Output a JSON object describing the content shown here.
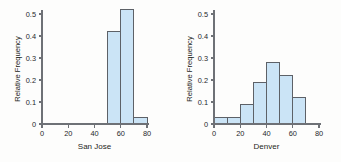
{
  "figure": {
    "background_color": "#fdfdfc",
    "bar_fill_color": "#cbe4f6",
    "bar_edge_color": "#5d6167",
    "axis_color": "#6e7176"
  },
  "chart_data": [
    {
      "type": "bar",
      "title": "",
      "xlabel": "San Jose",
      "ylabel": "Relative Frequency",
      "xlim": [
        0,
        80
      ],
      "ylim": [
        0,
        0.55
      ],
      "grid": false,
      "legend": "none",
      "xticks": [
        0,
        20,
        40,
        60,
        80
      ],
      "xtick_labels": [
        "0",
        "20",
        "40",
        "60",
        "80"
      ],
      "yticks": [
        0,
        0.1,
        0.2,
        0.3,
        0.4,
        0.5
      ],
      "ytick_labels": [
        "0",
        "0.1",
        "0.2",
        "0.3",
        "0.4",
        "0.5"
      ],
      "bin_edges": [
        50,
        60,
        70,
        80
      ],
      "categories": [
        "50-60",
        "60-70",
        "70-80"
      ],
      "values": [
        0.42,
        0.52,
        0.03
      ]
    },
    {
      "type": "bar",
      "title": "",
      "xlabel": "Denver",
      "ylabel": "Relative Frequency",
      "xlim": [
        0,
        80
      ],
      "ylim": [
        0,
        0.55
      ],
      "grid": false,
      "legend": "none",
      "xticks": [
        0,
        20,
        40,
        60,
        80
      ],
      "xtick_labels": [
        "0",
        "20",
        "40",
        "60",
        "80"
      ],
      "yticks": [
        0,
        0.1,
        0.2,
        0.3,
        0.4,
        0.5
      ],
      "ytick_labels": [
        "0",
        "0.1",
        "0.2",
        "0.3",
        "0.4",
        "0.5"
      ],
      "bin_edges": [
        0,
        10,
        20,
        30,
        40,
        50,
        60,
        70
      ],
      "categories": [
        "0-10",
        "10-20",
        "20-30",
        "30-40",
        "40-50",
        "50-60",
        "60-70"
      ],
      "values": [
        0.03,
        0.03,
        0.09,
        0.19,
        0.28,
        0.22,
        0.12
      ]
    }
  ]
}
